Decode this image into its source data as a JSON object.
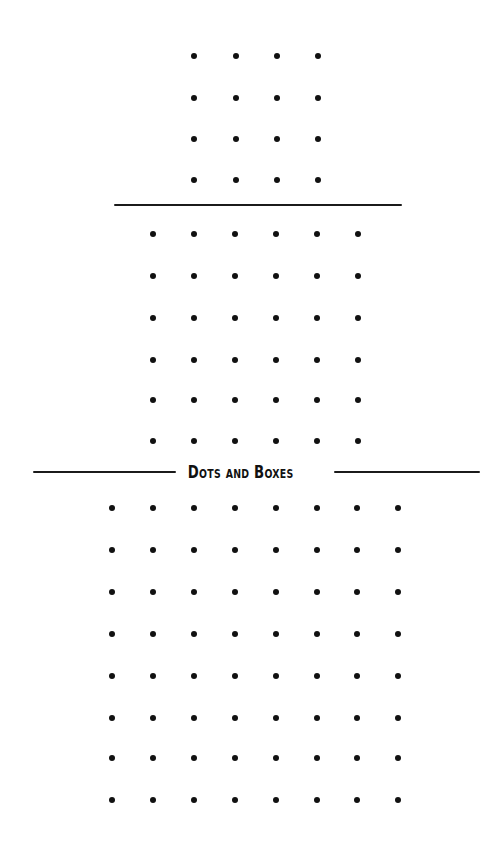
{
  "title": "Dots and Boxes",
  "colors": {
    "background": "#ffffff",
    "dot": "#111111",
    "rule": "#1a1a1a"
  },
  "grids": [
    {
      "name": "grid-small",
      "rows": 4,
      "cols": 4,
      "x": [
        194,
        236,
        277,
        318
      ],
      "y": [
        56,
        98,
        139,
        180
      ]
    },
    {
      "name": "grid-medium",
      "rows": 6,
      "cols": 6,
      "x": [
        153,
        194,
        235,
        276,
        317,
        358
      ],
      "y": [
        234,
        276,
        318,
        360,
        400,
        441
      ]
    },
    {
      "name": "grid-large",
      "rows": 8,
      "cols": 8,
      "x": [
        112,
        153,
        194,
        235,
        276,
        317,
        357,
        398
      ],
      "y": [
        508,
        550,
        592,
        634,
        676,
        718,
        758,
        800
      ]
    }
  ],
  "rules": [
    {
      "name": "separator-top",
      "x1": 114,
      "x2": 402,
      "y": 205
    },
    {
      "name": "title-rule-left",
      "x1": 33,
      "x2": 176,
      "y": 472
    },
    {
      "name": "title-rule-right",
      "x1": 334,
      "x2": 480,
      "y": 472
    }
  ]
}
